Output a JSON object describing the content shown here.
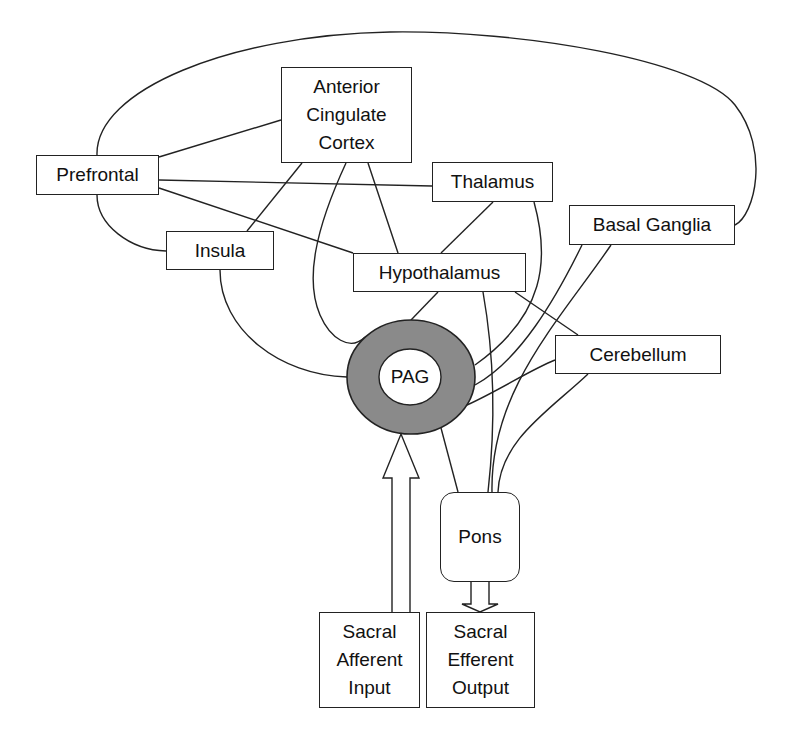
{
  "diagram": {
    "title": "",
    "nodes": {
      "acc": {
        "label": "Anterior\nCingulate\nCortex"
      },
      "prefrontal": {
        "label": "Prefrontal"
      },
      "thalamus": {
        "label": "Thalamus"
      },
      "basal_ganglia": {
        "label": "Basal Ganglia"
      },
      "insula": {
        "label": "Insula"
      },
      "hypothalamus": {
        "label": "Hypothalamus"
      },
      "cerebellum": {
        "label": "Cerebellum"
      },
      "pag": {
        "label": "PAG"
      },
      "pons": {
        "label": "Pons"
      },
      "sacral_afferent": {
        "label": "Sacral\nAfferent\nInput"
      },
      "sacral_efferent": {
        "label": "Sacral\nEfferent\nOutput"
      }
    },
    "edges": [
      {
        "from": "Prefrontal",
        "to": "Anterior Cingulate Cortex"
      },
      {
        "from": "Prefrontal",
        "to": "Thalamus"
      },
      {
        "from": "Prefrontal",
        "to": "Hypothalamus"
      },
      {
        "from": "Prefrontal",
        "to": "Insula"
      },
      {
        "from": "Prefrontal",
        "to": "Basal Ganglia"
      },
      {
        "from": "Anterior Cingulate Cortex",
        "to": "Insula"
      },
      {
        "from": "Anterior Cingulate Cortex",
        "to": "Hypothalamus"
      },
      {
        "from": "Anterior Cingulate Cortex",
        "to": "PAG"
      },
      {
        "from": "Thalamus",
        "to": "Hypothalamus"
      },
      {
        "from": "Thalamus",
        "to": "PAG"
      },
      {
        "from": "Insula",
        "to": "PAG"
      },
      {
        "from": "Hypothalamus",
        "to": "PAG"
      },
      {
        "from": "Hypothalamus",
        "to": "Pons"
      },
      {
        "from": "Hypothalamus",
        "to": "Cerebellum"
      },
      {
        "from": "Basal Ganglia",
        "to": "PAG"
      },
      {
        "from": "Basal Ganglia",
        "to": "Pons"
      },
      {
        "from": "Cerebellum",
        "to": "PAG"
      },
      {
        "from": "Cerebellum",
        "to": "Pons"
      },
      {
        "from": "PAG",
        "to": "Pons"
      },
      {
        "from": "Sacral Afferent Input",
        "to": "PAG",
        "type": "arrow"
      },
      {
        "from": "Pons",
        "to": "Sacral Efferent Output",
        "type": "arrow"
      }
    ],
    "colors": {
      "line": "#222222",
      "pag_ring": "#8a8a8a",
      "background": "#ffffff"
    }
  }
}
